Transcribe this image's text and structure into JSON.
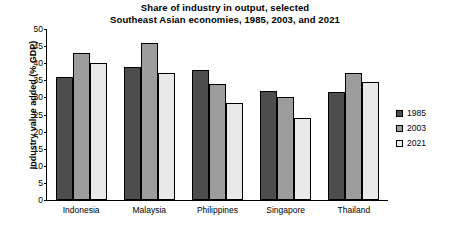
{
  "chart_data": {
    "type": "bar",
    "title": "Share of industry in output, selected Southeast Asian economies, 1985, 2003, and 2021",
    "title_lines": [
      "Share of industry in output, selected",
      "Southeast Asian economies, 1985, 2003, and 2021"
    ],
    "xlabel": "",
    "ylabel": "Industry value added (% GDP)",
    "ylim": [
      0,
      50
    ],
    "ytick_values": [
      0,
      5,
      10,
      15,
      20,
      25,
      30,
      35,
      40,
      45,
      50
    ],
    "ytick_labels": [
      "0",
      "5",
      "10",
      "15",
      "20",
      "25",
      "30",
      "35",
      "40",
      "45",
      "50"
    ],
    "grid": false,
    "legend_position": "right",
    "categories": [
      "Indonesia",
      "Malaysia",
      "Philippines",
      "Singapore",
      "Thailand"
    ],
    "series": [
      {
        "name": "1985",
        "color": "#4d4d4d",
        "values": [
          36,
          39,
          38,
          32,
          31.5
        ]
      },
      {
        "name": "2003",
        "color": "#9d9d9d",
        "values": [
          43,
          46,
          34,
          30,
          37
        ]
      },
      {
        "name": "2021",
        "color": "#e9e9e9",
        "values": [
          40,
          37,
          28.5,
          24,
          34.5
        ]
      }
    ]
  }
}
